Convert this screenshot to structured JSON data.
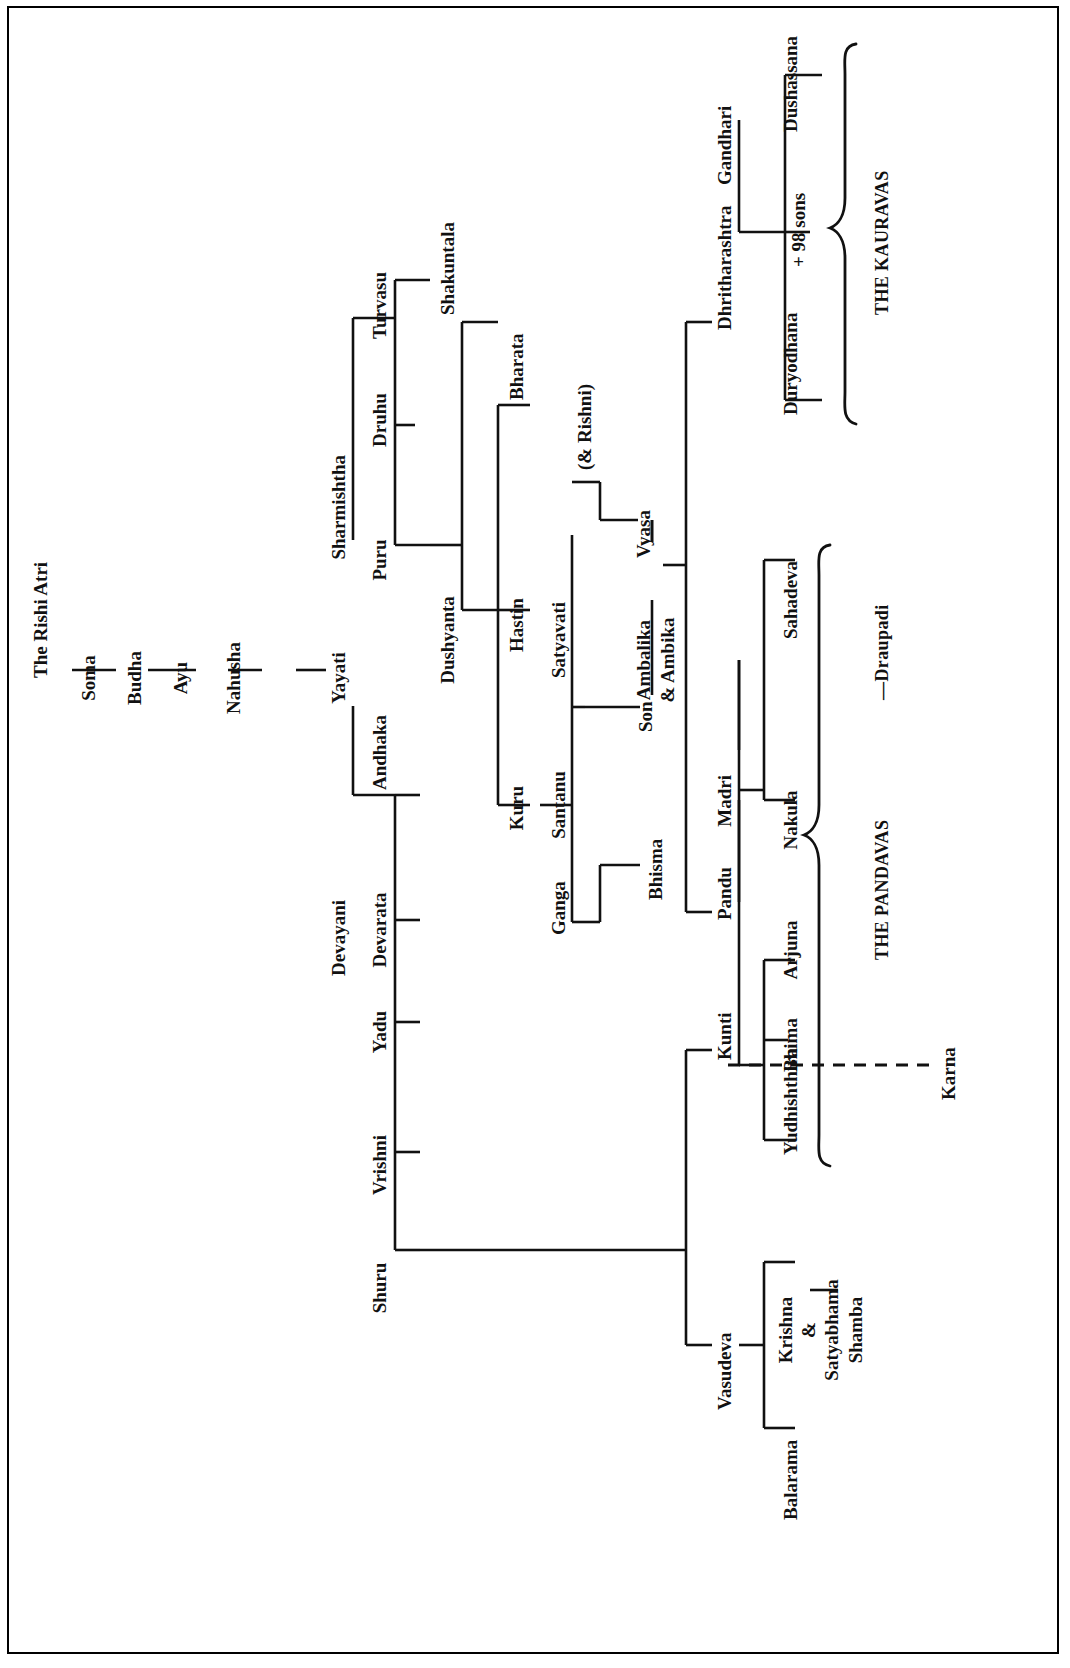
{
  "orientation": "rotated-90-ccw",
  "nodes": {
    "rishi_atri": "The Rishi Atri",
    "soma": "Soma",
    "budha": "Budha",
    "ayu": "Ayu",
    "nahusha": "Nahusha",
    "yayati": "Yayati",
    "sharmishtha": "Sharmishtha",
    "devayani": "Devayani",
    "turvasu": "Turvasu",
    "druhu": "Druhu",
    "puru": "Puru",
    "andhaka": "Andhaka",
    "devarata": "Devarata",
    "yadu": "Yadu",
    "vrishni": "Vrishni",
    "shuru": "Shuru",
    "dushyanta": "Dushyanta",
    "shakuntala": "Shakuntala",
    "bharata": "Bharata",
    "hastin": "Hastin",
    "kuru": "Kuru",
    "ganga": "Ganga",
    "santanu": "Santanu",
    "satyavati": "Satyavati",
    "rishni": "(& Rishni)",
    "bhisma": "Bhisma",
    "son": "Son",
    "ambalika_ambika_1": "Ambalika",
    "ambalika_ambika_2": "&  Ambika",
    "vyasa": "Vyasa",
    "dhritharashtra": "Dhritharashtra",
    "gandhari": "Gandhari",
    "duryodhana": "Duryodhana",
    "ninety_eight_sons": "+ 98 sons",
    "dushassana": "Dushassana",
    "pandu": "Pandu",
    "kunti": "Kunti",
    "madri": "Madri",
    "yudhishthira": "Yudhishthira",
    "bhima": "Bhima",
    "arjuna": "Arjuna",
    "nakula": "Nakula",
    "sahadeva": "Sahadeva",
    "karna": "Karna",
    "vasudeva": "Vasudeva",
    "balarama": "Balarama",
    "krishna_1": "Krishna",
    "krishna_2": "&",
    "krishna_3": "Satyabhama",
    "shamba": "Shamba"
  },
  "groups": {
    "kauravas": "THE KAURAVAS",
    "pandavas": "THE PANDAVAS",
    "draupadi": "—Draupadi"
  },
  "colors": {
    "ink": "#111111",
    "paper": "#ffffff",
    "frame": "#000000"
  }
}
